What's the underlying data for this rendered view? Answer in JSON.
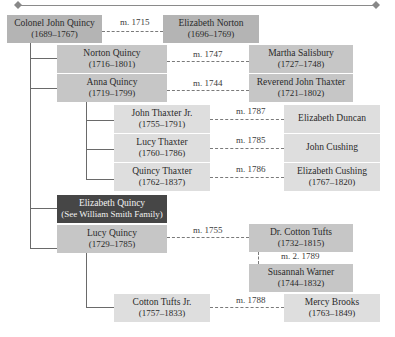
{
  "header": {
    "rule": "decorative-rule"
  },
  "people": {
    "john_quincy": {
      "name": "Colonel John Quincy",
      "dates": "(1689–1767)"
    },
    "elizabeth_norton": {
      "name": "Elizabeth Norton",
      "dates": "(1696–1769)"
    },
    "norton_quincy": {
      "name": "Norton Quincy",
      "dates": "(1716–1801)"
    },
    "martha_salisbury": {
      "name": "Martha Salisbury",
      "dates": "(1727–1748)"
    },
    "anna_quincy": {
      "name": "Anna Quincy",
      "dates": "(1719–1799)"
    },
    "john_thaxter": {
      "name": "Reverend John Thaxter",
      "dates": "(1721–1802)"
    },
    "john_thaxter_jr": {
      "name": "John Thaxter Jr.",
      "dates": "(1755–1791)"
    },
    "elizabeth_duncan": {
      "name": "Elizabeth Duncan",
      "dates": ""
    },
    "lucy_thaxter": {
      "name": "Lucy Thaxter",
      "dates": "(1760–1786)"
    },
    "john_cushing": {
      "name": "John Cushing",
      "dates": ""
    },
    "quincy_thaxter": {
      "name": "Quincy Thaxter",
      "dates": "(1762–1837)"
    },
    "elizabeth_cushing": {
      "name": "Elizabeth Cushing",
      "dates": "(1767–1820)"
    },
    "elizabeth_quincy": {
      "name": "Elizabeth Quincy",
      "dates": "(See William Smith Family)"
    },
    "lucy_quincy": {
      "name": "Lucy Quincy",
      "dates": "(1729–1785)"
    },
    "cotton_tufts": {
      "name": "Dr. Cotton Tufts",
      "dates": "(1732–1815)"
    },
    "susannah_warner": {
      "name": "Susannah Warner",
      "dates": "(1744–1832)"
    },
    "cotton_tufts_jr": {
      "name": "Cotton Tufts Jr.",
      "dates": "(1757–1833)"
    },
    "mercy_brooks": {
      "name": "Mercy Brooks",
      "dates": "(1763–1849)"
    }
  },
  "marriages": {
    "m1": "m. 1715",
    "m2": "m. 1747",
    "m3": "m. 1744",
    "m4": "m. 1787",
    "m5": "m. 1785",
    "m6": "m. 1786",
    "m7": "m. 1755",
    "m8": "m. 2. 1789",
    "m9": "m. 1788"
  },
  "colors": {
    "gen1": "#b4b4b4",
    "gen2": "#c6c6c6",
    "gen3": "#dedede",
    "highlight": "#464646",
    "connector": "#6a6a6a"
  }
}
